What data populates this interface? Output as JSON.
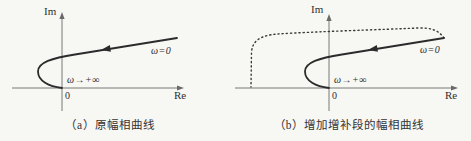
{
  "figure": {
    "background": "#f7f7f4",
    "axis_color": "#6a6a6a",
    "curve_color": "#2b2b2b",
    "dotted_color": "#3a3a3a",
    "panels": [
      {
        "id": "a",
        "caption": "（a）原幅相曲线",
        "im_label": "Im",
        "re_label": "Re",
        "origin_label": "0",
        "omega_start_label": "ω=0",
        "omega_end_label": "ω→+∞",
        "curves": [
          {
            "style": "solid",
            "meaning": "原幅相曲线"
          }
        ]
      },
      {
        "id": "b",
        "caption": "（b）增加增补段的幅相曲线",
        "im_label": "Im",
        "re_label": "Re",
        "origin_label": "0",
        "omega_start_label": "ω=0",
        "omega_end_label": "ω→+∞",
        "curves": [
          {
            "style": "solid",
            "meaning": "原幅相曲线"
          },
          {
            "style": "dotted",
            "meaning": "增补段"
          }
        ]
      }
    ]
  }
}
